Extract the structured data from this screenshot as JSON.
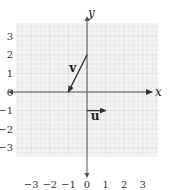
{
  "diagram": {
    "type": "coordinate-plane-vectors",
    "axes": {
      "x_label": "x",
      "y_label": "y",
      "x_ticks": [
        "−3",
        "−2",
        "−1",
        "0",
        "1",
        "2",
        "3"
      ],
      "y_ticks": [
        "3",
        "2",
        "1",
        "0",
        "−1",
        "−2",
        "−3"
      ],
      "range": [
        -3.5,
        3.5
      ]
    },
    "grid": {
      "minor_per_unit": 4,
      "color": "#e2e2e2",
      "background": "#f3f3f3"
    },
    "vectors": [
      {
        "name": "v",
        "label": "v",
        "from": [
          0,
          2
        ],
        "to": [
          -1,
          0
        ],
        "color": "#333333"
      },
      {
        "name": "u",
        "label": "u",
        "from": [
          0,
          -1
        ],
        "to": [
          1,
          -1
        ],
        "color": "#333333"
      }
    ]
  }
}
